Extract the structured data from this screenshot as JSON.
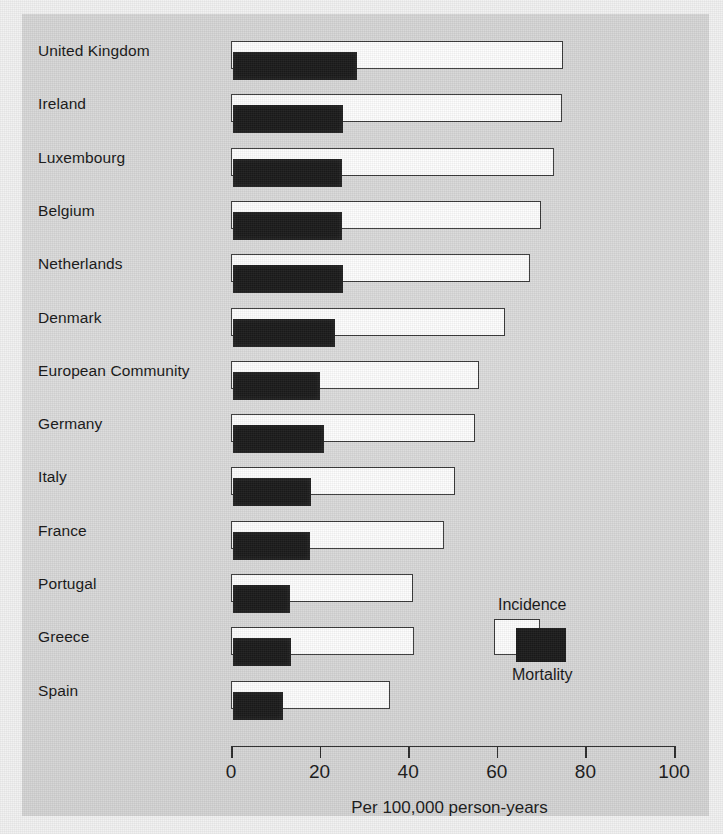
{
  "chart_data": {
    "type": "bar",
    "orientation": "horizontal",
    "title": "",
    "xlabel": "Per 100,000 person-years",
    "ylabel": "",
    "xlim": [
      0,
      100
    ],
    "xticks": [
      0,
      20,
      40,
      60,
      80,
      100
    ],
    "xtick_labels": [
      "0",
      "20",
      "40",
      "60",
      "80",
      "100"
    ],
    "grid": false,
    "legend_position": "inside-lower-right",
    "categories": [
      "United Kingdom",
      "Ireland",
      "Luxembourg",
      "Belgium",
      "Netherlands",
      "Denmark",
      "European Community",
      "Germany",
      "Italy",
      "France",
      "Portugal",
      "Greece",
      "Spain"
    ],
    "series": [
      {
        "name": "Incidence",
        "color": "#fdfdfd",
        "values": [
          75.0,
          74.7,
          73.0,
          70.0,
          67.5,
          61.8,
          56.0,
          55.0,
          50.5,
          48.0,
          41.0,
          41.3,
          35.9
        ]
      },
      {
        "name": "Mortality",
        "color": "#1b1b1b",
        "values": [
          28.0,
          24.8,
          24.6,
          24.6,
          24.8,
          23.0,
          19.6,
          20.5,
          17.6,
          17.3,
          12.9,
          13.0,
          11.3
        ]
      }
    ]
  },
  "legend": {
    "incidence_label": "Incidence",
    "mortality_label": "Mortality"
  },
  "axis": {
    "title": "Per 100,000 person-years"
  },
  "colors": {
    "background": "#d9d9d9",
    "incidence_fill": "#fdfdfd",
    "mortality_fill": "#1b1b1b",
    "outline": "#3a3a3a",
    "text": "#161616"
  }
}
